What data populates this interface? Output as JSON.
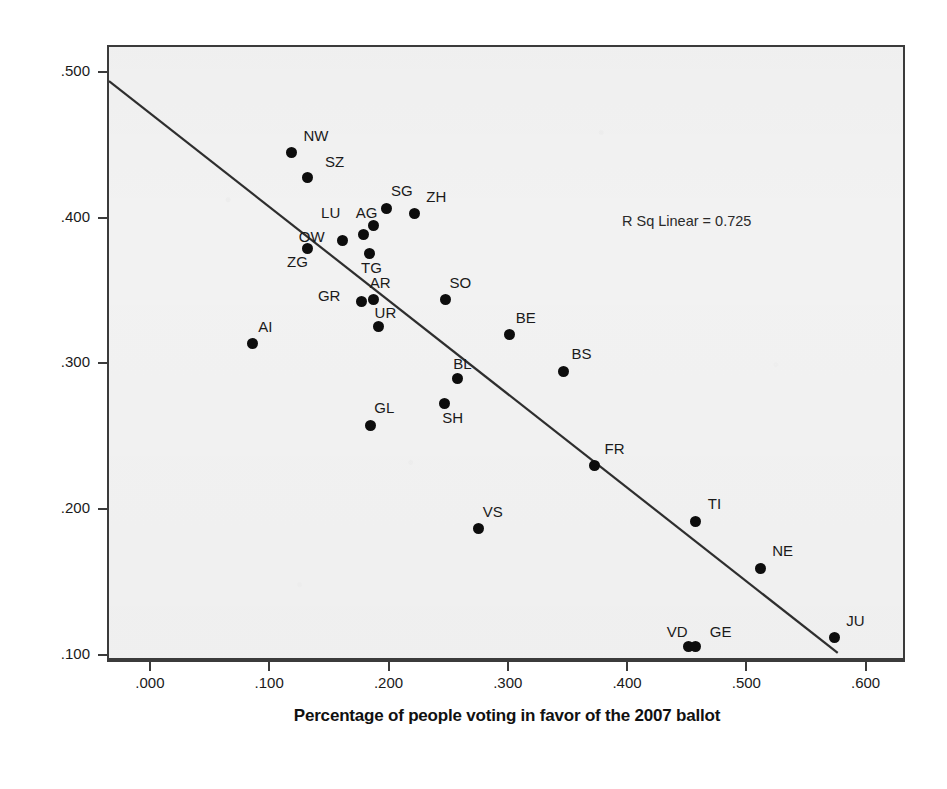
{
  "chart_data": {
    "type": "scatter",
    "title": "",
    "xlabel": "Percentage of people voting in favor of the 2007 ballot",
    "ylabel": "Percentage of people voting in favor of the 2008 ballot",
    "xlim": [
      -0.036,
      0.633
    ],
    "ylim": [
      0.0965,
      0.5185
    ],
    "xticks": [
      ".000",
      ".100",
      ".200",
      ".300",
      ".400",
      ".500",
      ".600"
    ],
    "xtick_values": [
      0.0,
      0.1,
      0.2,
      0.3,
      0.4,
      0.5,
      0.6
    ],
    "yticks": [
      ".500",
      ".400",
      ".300",
      ".200",
      ".100"
    ],
    "ytick_values": [
      0.5,
      0.4,
      0.3,
      0.2,
      0.1
    ],
    "grid": false,
    "legend": null,
    "annotation": "R Sq Linear = 0.725",
    "fit_line": {
      "type": "linear",
      "x_start": -0.036,
      "y_start": 0.495,
      "x_end": 0.578,
      "y_end": 0.1
    },
    "point_color": "#0d0d0d",
    "plot_background": "#f2f2f2",
    "frame_color": "#3b3b3b",
    "labels_field": "canton",
    "points": [
      {
        "canton": "NW",
        "x": 0.117,
        "y": 0.446,
        "lx": 12,
        "ly": -26
      },
      {
        "canton": "SZ",
        "x": 0.13,
        "y": 0.429,
        "lx": 18,
        "ly": -24
      },
      {
        "canton": "SG",
        "x": 0.197,
        "y": 0.408,
        "lx": 4,
        "ly": -26
      },
      {
        "canton": "ZH",
        "x": 0.22,
        "y": 0.404,
        "lx": 12,
        "ly": -26
      },
      {
        "canton": "AG",
        "x": 0.186,
        "y": 0.396,
        "lx": -18,
        "ly": -22
      },
      {
        "canton": "LU",
        "x": 0.177,
        "y": 0.39,
        "lx": -42,
        "ly": -30
      },
      {
        "canton": "OW",
        "x": 0.16,
        "y": 0.386,
        "lx": -44,
        "ly": -12
      },
      {
        "canton": "ZG",
        "x": 0.13,
        "y": 0.38,
        "lx": -20,
        "ly": 4
      },
      {
        "canton": "TG",
        "x": 0.182,
        "y": 0.377,
        "lx": -8,
        "ly": 6
      },
      {
        "canton": "SO",
        "x": 0.246,
        "y": 0.345,
        "lx": 4,
        "ly": -26
      },
      {
        "canton": "GR",
        "x": 0.176,
        "y": 0.344,
        "lx": -44,
        "ly": -14
      },
      {
        "canton": "AR",
        "x": 0.186,
        "y": 0.345,
        "lx": -4,
        "ly": -26
      },
      {
        "canton": "UR",
        "x": 0.19,
        "y": 0.327,
        "lx": -4,
        "ly": -22
      },
      {
        "canton": "AI",
        "x": 0.084,
        "y": 0.315,
        "lx": 6,
        "ly": -26
      },
      {
        "canton": "BE",
        "x": 0.3,
        "y": 0.321,
        "lx": 6,
        "ly": -26
      },
      {
        "canton": "BS",
        "x": 0.345,
        "y": 0.296,
        "lx": 8,
        "ly": -26
      },
      {
        "canton": "BL",
        "x": 0.256,
        "y": 0.291,
        "lx": -4,
        "ly": -24
      },
      {
        "canton": "SH",
        "x": 0.245,
        "y": 0.274,
        "lx": -2,
        "ly": 6
      },
      {
        "canton": "GL",
        "x": 0.183,
        "y": 0.259,
        "lx": 4,
        "ly": -26
      },
      {
        "canton": "VS",
        "x": 0.274,
        "y": 0.188,
        "lx": 4,
        "ly": -26
      },
      {
        "canton": "FR",
        "x": 0.371,
        "y": 0.231,
        "lx": 10,
        "ly": -26
      },
      {
        "canton": "TI",
        "x": 0.456,
        "y": 0.193,
        "lx": 12,
        "ly": -26
      },
      {
        "canton": "NE",
        "x": 0.51,
        "y": 0.161,
        "lx": 12,
        "ly": -26
      },
      {
        "canton": "JU",
        "x": 0.572,
        "y": 0.113,
        "lx": 12,
        "ly": -26
      },
      {
        "canton": "VD",
        "x": 0.45,
        "y": 0.107,
        "lx": -22,
        "ly": -24
      },
      {
        "canton": "GE",
        "x": 0.456,
        "y": 0.107,
        "lx": 14,
        "ly": -24
      }
    ]
  }
}
